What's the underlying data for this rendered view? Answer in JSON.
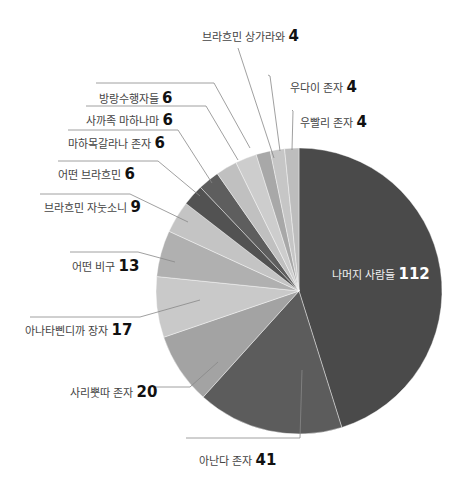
{
  "chart_data": {
    "type": "pie",
    "title": "",
    "total": 248,
    "start_angle_deg": 0,
    "direction": "clockwise",
    "slices": [
      {
        "label": "나머지 사람들",
        "value": 112,
        "color": "#4a4a4a"
      },
      {
        "label": "아난다 존자",
        "value": 41,
        "color": "#5c5c5c"
      },
      {
        "label": "사리뿟따 존자",
        "value": 20,
        "color": "#a3a3a3"
      },
      {
        "label": "아나타삔디까 장자",
        "value": 17,
        "color": "#c9c9c9"
      },
      {
        "label": "어떤 비구",
        "value": 13,
        "color": "#b0b0b0"
      },
      {
        "label": "브라흐민 자눗소니",
        "value": 9,
        "color": "#c4c4c4"
      },
      {
        "label": "어떤 브라흐민",
        "value": 6,
        "color": "#525252"
      },
      {
        "label": "마하목갈라나 존자",
        "value": 6,
        "color": "#5e5e5e"
      },
      {
        "label": "사까족 마하나마",
        "value": 6,
        "color": "#c0c0c0"
      },
      {
        "label": "방랑수행자들",
        "value": 6,
        "color": "#cdcdcd"
      },
      {
        "label": "브라흐민 상가라와",
        "value": 4,
        "color": "#a8a8a8"
      },
      {
        "label": "우다이 존자",
        "value": 4,
        "color": "#c6c6c6"
      },
      {
        "label": "우빨리 존자",
        "value": 4,
        "color": "#bdbdbd"
      }
    ],
    "legend": "none (callout labels)"
  },
  "labels": [
    {
      "name": "나머지 사람들",
      "value": "112",
      "x": 332,
      "y": 266,
      "inside": true
    },
    {
      "name": "아난다 존자",
      "value": "41",
      "x": 199,
      "y": 452
    },
    {
      "name": "사리뿟따 존자",
      "value": "20",
      "x": 70,
      "y": 384
    },
    {
      "name": "아나타삔디까 장자",
      "value": "17",
      "x": 25,
      "y": 322
    },
    {
      "name": "어떤 비구",
      "value": "13",
      "x": 72,
      "y": 258
    },
    {
      "name": "브라흐민 자눗소니",
      "value": "9",
      "x": 44,
      "y": 199
    },
    {
      "name": "어떤 브라흐민",
      "value": "6",
      "x": 58,
      "y": 166
    },
    {
      "name": "마하목갈라나 존자",
      "value": "6",
      "x": 68,
      "y": 135
    },
    {
      "name": "사까족 마하나마",
      "value": "6",
      "x": 86,
      "y": 112
    },
    {
      "name": "방랑수행자들",
      "value": "6",
      "x": 99,
      "y": 90
    },
    {
      "name": "브라흐민 상가라와",
      "value": "4",
      "x": 202,
      "y": 28
    },
    {
      "name": "우다이 존자",
      "value": "4",
      "x": 290,
      "y": 79
    },
    {
      "name": "우빨리 존자",
      "value": "4",
      "x": 300,
      "y": 114
    }
  ],
  "leaders": [
    {
      "pts": [
        [
          186,
          438
        ],
        [
          300,
          438
        ],
        [
          302,
          370
        ]
      ]
    },
    {
      "pts": [
        [
          155,
          387
        ],
        [
          190,
          387
        ],
        [
          218,
          362
        ]
      ]
    },
    {
      "pts": [
        [
          30,
          317
        ],
        [
          140,
          317
        ],
        [
          200,
          300
        ]
      ]
    },
    {
      "pts": [
        [
          70,
          252
        ],
        [
          138,
          252
        ],
        [
          175,
          262
        ]
      ]
    },
    {
      "pts": [
        [
          40,
          194
        ],
        [
          130,
          194
        ],
        [
          188,
          222
        ]
      ]
    },
    {
      "pts": [
        [
          58,
          161
        ],
        [
          158,
          161
        ],
        [
          200,
          196
        ]
      ]
    },
    {
      "pts": [
        [
          68,
          130
        ],
        [
          178,
          130
        ],
        [
          212,
          183
        ]
      ]
    },
    {
      "pts": [
        [
          86,
          106
        ],
        [
          206,
          106
        ],
        [
          238,
          160
        ]
      ]
    },
    {
      "pts": [
        [
          96,
          83
        ],
        [
          214,
          83
        ],
        [
          250,
          148
        ]
      ]
    },
    {
      "pts": [
        [
          238,
          48
        ],
        [
          274,
          158
        ]
      ]
    },
    {
      "pts": [
        [
          268,
          75
        ],
        [
          270,
          76
        ],
        [
          280,
          151
        ]
      ]
    },
    {
      "pts": [
        [
          292,
          110
        ],
        [
          293,
          111
        ],
        [
          292,
          150
        ]
      ]
    }
  ]
}
